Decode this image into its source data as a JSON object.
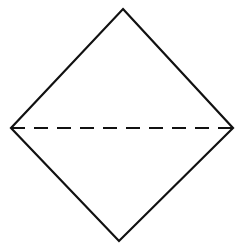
{
  "diagram": {
    "stroke_color": "#111111",
    "background": "#ffffff",
    "vertices": {
      "top": [
        123,
        9
      ],
      "right": [
        233,
        128
      ],
      "bottom": [
        119,
        241
      ],
      "left": [
        11,
        128
      ]
    },
    "solid_edges": [
      [
        "left",
        "top"
      ],
      [
        "top",
        "right"
      ],
      [
        "right",
        "bottom"
      ],
      [
        "bottom",
        "left"
      ]
    ],
    "dashed_line": {
      "from": "left",
      "to": "right",
      "dash_pattern": "14 9"
    }
  }
}
